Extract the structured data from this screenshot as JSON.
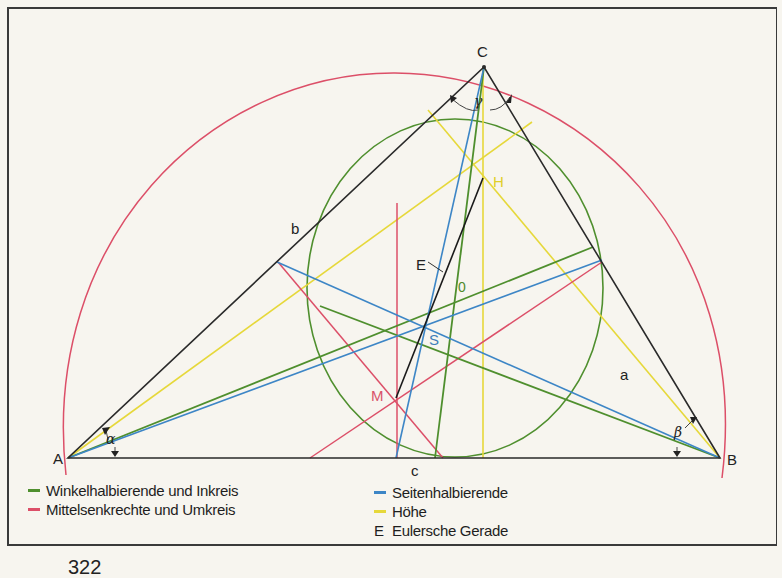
{
  "diagram": {
    "vertices": {
      "A": {
        "label": "A",
        "x": 68,
        "y": 458
      },
      "B": {
        "label": "B",
        "x": 720,
        "y": 458
      },
      "C": {
        "label": "C",
        "x": 484,
        "y": 67
      }
    },
    "sides": {
      "a": {
        "label": "a"
      },
      "b": {
        "label": "b"
      },
      "c": {
        "label": "c"
      }
    },
    "angles": {
      "alpha": {
        "label": "α"
      },
      "beta": {
        "label": "β"
      },
      "gamma": {
        "label": "γ"
      }
    },
    "points": {
      "H": {
        "label": "H",
        "color": "#e0cf2a"
      },
      "S": {
        "label": "S",
        "color": "#3f7fb8"
      },
      "O": {
        "label": "0",
        "color": "#4f8a2a"
      },
      "M": {
        "label": "M",
        "color": "#d9536a"
      },
      "E": {
        "label": "E",
        "color": "#222222"
      }
    },
    "colors": {
      "angle_bisector": "#4f8f2e",
      "perpendicular_bisector": "#dc4f68",
      "median": "#3d86c6",
      "altitude": "#e6d83a",
      "euler_line": "#1a1a1a",
      "triangle": "#2a2a2a"
    }
  },
  "legend": {
    "items": [
      {
        "marker": "line",
        "color": "#4f8f2e",
        "label": "Winkelhalbierende und Inkreis"
      },
      {
        "marker": "line",
        "color": "#dc4f68",
        "label": "Mittelsenkrechte und Umkreis"
      },
      {
        "marker": "line",
        "color": "#3d86c6",
        "label": "Seitenhalbierende"
      },
      {
        "marker": "line",
        "color": "#e6d83a",
        "label": "Höhe"
      },
      {
        "marker": "letter",
        "letter": "E",
        "label": "Eulersche Gerade"
      }
    ]
  },
  "page": {
    "number": "322"
  }
}
